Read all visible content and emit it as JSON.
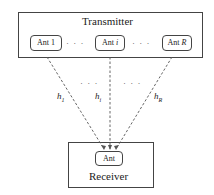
{
  "transmitter": {
    "title": "Transmitter",
    "antennas": [
      {
        "prefix": "Ant ",
        "index": "1"
      },
      {
        "prefix": "Ant ",
        "index": "i"
      },
      {
        "prefix": "Ant ",
        "index": "R"
      }
    ],
    "ellipsis": "· · ·"
  },
  "channels": [
    {
      "symbol": "h",
      "sub": "1"
    },
    {
      "symbol": "h",
      "sub": "i"
    },
    {
      "symbol": "h",
      "sub": "R"
    }
  ],
  "channel_ellipsis": "· · ·",
  "receiver": {
    "title": "Receiver",
    "antenna": "Ant"
  }
}
